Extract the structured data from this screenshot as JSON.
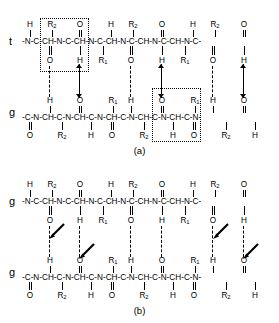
{
  "figure": {
    "type": "chemical-structure-diagram",
    "panels": [
      {
        "id": "a",
        "caption": "(a)",
        "chain_labels": {
          "top": "t",
          "bottom": "g"
        },
        "arrow_style": "vertical-double-headed",
        "repeat_boxes": 2,
        "top_chain": {
          "backbone": "-N-C-CH-N-C-CH-N-C-CH-N-C-CH-N-C-CH-N-C-",
          "above_labels": [
            "H",
            "R2",
            "O",
            "H",
            "R2",
            "O",
            "H",
            "R2",
            "O"
          ],
          "below_labels": [
            "O",
            "H",
            "R1",
            "O",
            "H",
            "R1",
            "O",
            "H"
          ]
        },
        "bottom_chain": {
          "backbone": "-C-N-CH-C-N-CH-C-N-CH-C-N-CH-C-N-CH-C-N-",
          "above_labels": [
            "H",
            "O",
            "R1",
            "H",
            "O",
            "R1",
            "H",
            "O"
          ],
          "below_labels": [
            "O",
            "R2",
            "H",
            "O",
            "R2",
            "H",
            "O",
            "R2",
            "H"
          ]
        }
      },
      {
        "id": "b",
        "caption": "(b)",
        "chain_labels": {
          "top": "g",
          "bottom": "g"
        },
        "arrow_style": "diagonal",
        "repeat_boxes": 0,
        "top_chain": {
          "backbone": "-N-C-CH-N-C-CH-N-C-CH-N-C-CH-N-C-CH-N-C-",
          "above_labels": [
            "H",
            "R2",
            "O",
            "H",
            "R2",
            "O",
            "H",
            "R2",
            "O"
          ],
          "below_labels": [
            "O",
            "H",
            "R1",
            "O",
            "H",
            "R1",
            "O",
            "H"
          ]
        },
        "bottom_chain": {
          "backbone": "-C-N-CH-C-N-CH-C-N-CH-C-N-CH-C-N-CH-C-N-",
          "above_labels": [
            "H",
            "O",
            "R1",
            "H",
            "O",
            "R1",
            "H",
            "O"
          ],
          "below_labels": [
            "O",
            "R2",
            "H",
            "O",
            "R2",
            "H",
            "O",
            "R2",
            "H"
          ]
        }
      }
    ],
    "atom_glyphs": {
      "nitrogen": "N",
      "carbon": "C",
      "methine": "CH",
      "oxygen": "O",
      "hydrogen": "H",
      "sidechain_1": "R1",
      "sidechain_2": "R2"
    }
  }
}
